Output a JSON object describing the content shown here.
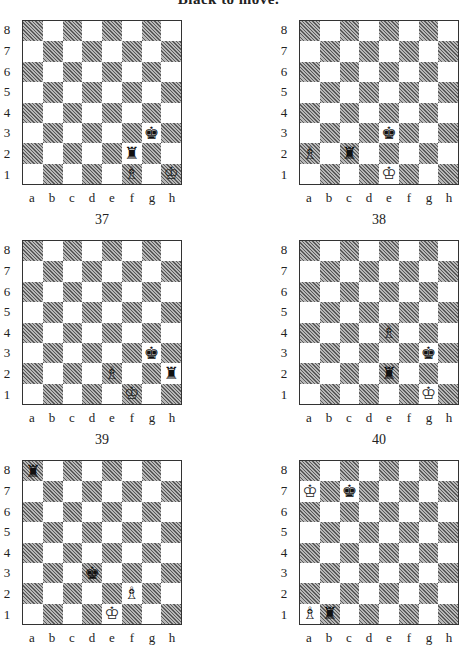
{
  "title": "Black to move.",
  "rank_labels": [
    "8",
    "7",
    "6",
    "5",
    "4",
    "3",
    "2",
    "1"
  ],
  "file_labels": [
    "a",
    "b",
    "c",
    "d",
    "e",
    "f",
    "g",
    "h"
  ],
  "diagrams": [
    {
      "number": "37",
      "pieces": [
        {
          "square": "g3",
          "color": "black",
          "type": "king"
        },
        {
          "square": "f2",
          "color": "black",
          "type": "rook"
        },
        {
          "square": "f1",
          "color": "white",
          "type": "bishop"
        },
        {
          "square": "h1",
          "color": "white",
          "type": "king"
        }
      ]
    },
    {
      "number": "38",
      "pieces": [
        {
          "square": "e3",
          "color": "black",
          "type": "king"
        },
        {
          "square": "c2",
          "color": "black",
          "type": "rook"
        },
        {
          "square": "a2",
          "color": "white",
          "type": "bishop"
        },
        {
          "square": "e1",
          "color": "white",
          "type": "king"
        }
      ]
    },
    {
      "number": "39",
      "pieces": [
        {
          "square": "g3",
          "color": "black",
          "type": "king"
        },
        {
          "square": "h2",
          "color": "black",
          "type": "rook"
        },
        {
          "square": "e2",
          "color": "white",
          "type": "bishop"
        },
        {
          "square": "f1",
          "color": "white",
          "type": "king"
        }
      ]
    },
    {
      "number": "40",
      "pieces": [
        {
          "square": "e4",
          "color": "white",
          "type": "bishop"
        },
        {
          "square": "g3",
          "color": "black",
          "type": "king"
        },
        {
          "square": "e2",
          "color": "black",
          "type": "rook"
        },
        {
          "square": "g1",
          "color": "white",
          "type": "king"
        }
      ]
    },
    {
      "number": "",
      "pieces": [
        {
          "square": "a8",
          "color": "black",
          "type": "rook"
        },
        {
          "square": "d3",
          "color": "black",
          "type": "king"
        },
        {
          "square": "f2",
          "color": "white",
          "type": "bishop"
        },
        {
          "square": "e1",
          "color": "white",
          "type": "king"
        }
      ]
    },
    {
      "number": "",
      "pieces": [
        {
          "square": "a7",
          "color": "white",
          "type": "king"
        },
        {
          "square": "c7",
          "color": "black",
          "type": "king"
        },
        {
          "square": "a1",
          "color": "white",
          "type": "bishop"
        },
        {
          "square": "b1",
          "color": "black",
          "type": "rook"
        }
      ]
    }
  ]
}
